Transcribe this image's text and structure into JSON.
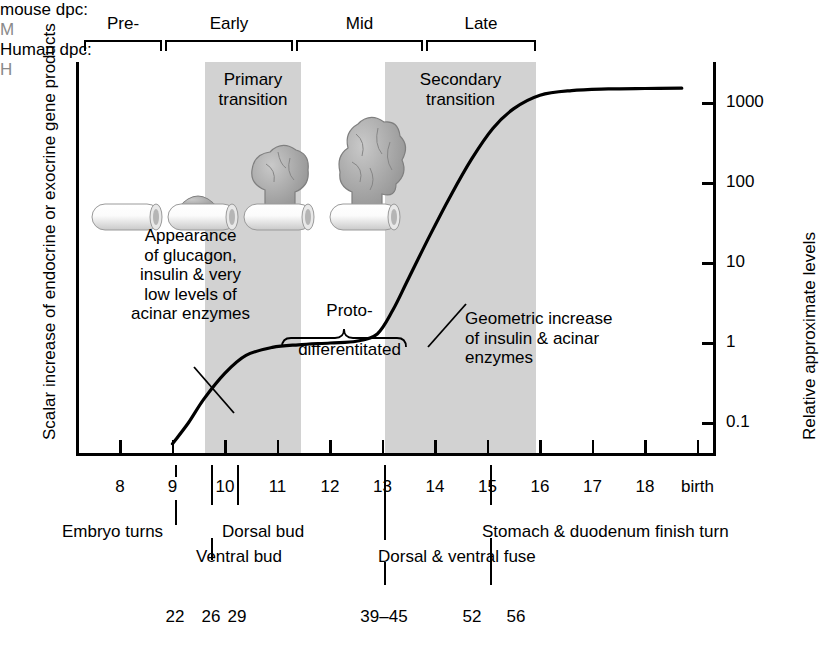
{
  "figure": {
    "axis_left_label": "Scalar increase of endocrine or exocrine gene products",
    "axis_right_label": "Relative approximate levels",
    "mouse_row_label": "mouse dpc:",
    "human_row_label": "Human dpc:"
  },
  "stage_brackets": [
    {
      "label": "Pre-",
      "x": 84,
      "w": 78
    },
    {
      "label": "Early",
      "x": 165,
      "w": 128
    },
    {
      "label": "Mid",
      "x": 296,
      "w": 127
    },
    {
      "label": "Late",
      "x": 426,
      "w": 110
    }
  ],
  "bands": [
    {
      "label_line1": "Primary",
      "label_line2": "transition",
      "x": 205,
      "w": 96
    },
    {
      "label_line1": "Secondary",
      "label_line2": "transition",
      "x": 385,
      "w": 151
    }
  ],
  "annotations": {
    "appearance": "Appearance\nof glucagon,\ninsulin & very\nlow levels of\nacinar enzymes",
    "proto_line1": "Proto-",
    "proto_line2": "differentitated",
    "geometric": "Geometric increase\nof insulin & acinar\nenzymes"
  },
  "y_axis": {
    "ticks": [
      {
        "label": "1000",
        "value": 1000
      },
      {
        "label": "100",
        "value": 100
      },
      {
        "label": "10",
        "value": 10
      },
      {
        "label": "1",
        "value": 1
      },
      {
        "label": "0.1",
        "value": 0.1
      }
    ]
  },
  "x_axis": {
    "mouse_ticks": [
      "8",
      "9",
      "10",
      "11",
      "12",
      "13",
      "14",
      "15",
      "16",
      "17",
      "18",
      "birth"
    ],
    "species_marker_mouse": "M",
    "species_marker_human": "H"
  },
  "event_labels": [
    {
      "text": "Embryo turns"
    },
    {
      "text": "Ventral bud"
    },
    {
      "text": "Dorsal bud"
    },
    {
      "text": "Dorsal & ventral fuse"
    },
    {
      "text": "Stomach & duodenum finish turn"
    }
  ],
  "human_dpc": [
    "22",
    "26",
    "29",
    "39–45",
    "52",
    "56"
  ],
  "colors": {
    "band_gray": "#d2d2d2",
    "ink": "#000000",
    "species_marker": "#8a8a8a"
  },
  "chart_data": {
    "type": "line",
    "title": "",
    "xlabel": "mouse dpc",
    "ylabel": "Relative approximate levels",
    "ylim": [
      0.04,
      3000
    ],
    "yscale": "log",
    "xlim": [
      8,
      19
    ],
    "grid": false,
    "legend": "none",
    "series": [
      {
        "name": "Relative approximate levels of endocrine/exocrine gene products",
        "x": [
          9.0,
          9.3,
          9.6,
          10.0,
          10.4,
          10.9,
          11.4,
          12.0,
          12.5,
          12.9,
          13.2,
          13.5,
          13.9,
          14.3,
          14.7,
          15.1,
          15.5,
          16.0,
          16.6,
          17.3,
          18.0,
          18.7
        ],
        "y": [
          0.055,
          0.1,
          0.2,
          0.42,
          0.7,
          0.88,
          0.95,
          1.0,
          1.05,
          1.3,
          2.6,
          6.5,
          22,
          70,
          200,
          480,
          850,
          1250,
          1430,
          1500,
          1520,
          1530
        ]
      }
    ]
  }
}
